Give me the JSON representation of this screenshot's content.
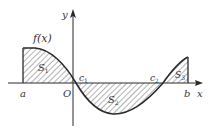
{
  "figure": {
    "function_label": "f(x)",
    "axis_x_label": "x",
    "axis_y_label": "y",
    "origin_label": "O",
    "point_labels": {
      "a": "a",
      "b": "b",
      "c1": "c",
      "c1_sub": "1",
      "c2": "c",
      "c2_sub": "2"
    },
    "region_labels": {
      "S1": "S",
      "S1_sub": "1",
      "S2": "S",
      "S2_sub": "2",
      "S3": "S",
      "S3_sub": "3"
    },
    "colors": {
      "stroke": "#2a2a2a",
      "hatch": "#555555",
      "text": "#333333"
    }
  }
}
